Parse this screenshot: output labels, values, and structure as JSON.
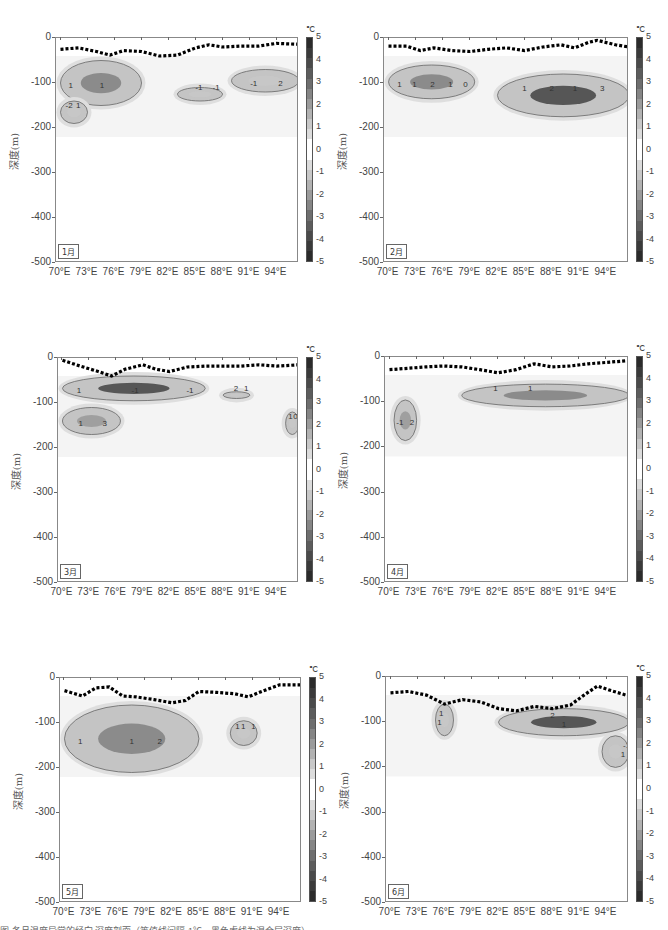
{
  "figure": {
    "y_label": "深度(m)",
    "colorbar_unit": "℃",
    "colorbar_ticks": [
      "5",
      "4",
      "3",
      "2",
      "1",
      "0",
      "-1",
      "-2",
      "-3",
      "-4",
      "-5"
    ],
    "colorbar_colors": [
      "#2b2b2b",
      "#3a3a3a",
      "#4a4a4a",
      "#5c5c5c",
      "#6e6e6e",
      "#858585",
      "#9b9b9b",
      "#b2b2b2",
      "#c8c8c8",
      "#dcdcdc",
      "#ffffff",
      "#ffffff",
      "#dcdcdc",
      "#c8c8c8",
      "#b2b2b2",
      "#9b9b9b",
      "#858585",
      "#6e6e6e",
      "#5c5c5c",
      "#4a4a4a",
      "#3a3a3a",
      "#2b2b2b"
    ],
    "y_ticks": [
      "0",
      "-100",
      "-200",
      "-300",
      "-400",
      "-500"
    ],
    "x_ticks": [
      "70°E",
      "73°E",
      "76°E",
      "79°E",
      "82°E",
      "85°E",
      "88°E",
      "91°E",
      "94°E"
    ],
    "caption_partial": "图 各月温度异常的经向-深度剖面（等值线间隔 1℃，黑色虚线为混合层深度）"
  },
  "chart_data": [
    {
      "type": "heatmap",
      "title": "1月",
      "xlabel": "",
      "ylabel": "深度(m)",
      "x_range": [
        "69.5°E",
        "96.5°E"
      ],
      "ylim": [
        -500,
        0
      ],
      "x_ticks": [
        "70°E",
        "73°E",
        "76°E",
        "79°E",
        "82°E",
        "85°E",
        "88°E",
        "91°E",
        "94°E"
      ],
      "y_ticks": [
        0,
        -100,
        -200,
        -300,
        -400,
        -500
      ],
      "colorbar": {
        "unit": "℃",
        "range": [
          -5,
          5
        ],
        "ticks": [
          5,
          4,
          3,
          2,
          1,
          0,
          -1,
          -2,
          -3,
          -4,
          -5
        ]
      },
      "contour_labels": [
        "1",
        "-1",
        "2",
        "-2",
        "1",
        "-1",
        "-1",
        "1"
      ],
      "mixed_layer_depth": {
        "lon": [
          70,
          72,
          74,
          75.5,
          77,
          79,
          81,
          83,
          85,
          86.5,
          88,
          90,
          92,
          94,
          96.5
        ],
        "depth": [
          -25,
          -22,
          -30,
          -38,
          -28,
          -30,
          -40,
          -38,
          -22,
          -15,
          -20,
          -18,
          -18,
          -12,
          -14
        ]
      },
      "anomaly_regions": [
        {
          "lon": [
            70,
            79
          ],
          "depth": [
            -50,
            -150
          ],
          "peak": "-2 to 2"
        },
        {
          "lon": [
            83,
            88
          ],
          "depth": [
            -110,
            -140
          ],
          "peak": "-1"
        },
        {
          "lon": [
            89,
            96.5
          ],
          "depth": [
            -70,
            -120
          ],
          "peak": "-1"
        },
        {
          "lon": [
            70,
            73
          ],
          "depth": [
            -140,
            -190
          ],
          "peak": "1"
        }
      ]
    },
    {
      "type": "heatmap",
      "title": "2月",
      "xlabel": "",
      "ylabel": "深度(m)",
      "x_range": [
        "69.5°E",
        "96.5°E"
      ],
      "ylim": [
        -500,
        0
      ],
      "x_ticks": [
        "70°E",
        "73°E",
        "76°E",
        "79°E",
        "82°E",
        "85°E",
        "88°E",
        "91°E",
        "94°E"
      ],
      "y_ticks": [
        0,
        -100,
        -200,
        -300,
        -400,
        -500
      ],
      "colorbar": {
        "unit": "℃",
        "range": [
          -5,
          5
        ],
        "ticks": [
          5,
          4,
          3,
          2,
          1,
          0,
          -1,
          -2,
          -3,
          -4,
          -5
        ]
      },
      "contour_labels": [
        "1",
        "2",
        "1",
        "1",
        "2",
        "3",
        "1",
        "1",
        "0"
      ],
      "mixed_layer_depth": {
        "lon": [
          70,
          72,
          73.5,
          75,
          77,
          79,
          81,
          83,
          85,
          87,
          89,
          90.5,
          92,
          93,
          95,
          96.5
        ],
        "depth": [
          -18,
          -18,
          -28,
          -22,
          -28,
          -30,
          -25,
          -22,
          -28,
          -20,
          -15,
          -22,
          -10,
          -5,
          -15,
          -20
        ]
      },
      "anomaly_regions": [
        {
          "lon": [
            70,
            79.5
          ],
          "depth": [
            -60,
            -135
          ],
          "peak": "2"
        },
        {
          "lon": [
            82,
            96.5
          ],
          "depth": [
            -80,
            -175
          ],
          "peak": "4"
        }
      ]
    },
    {
      "type": "heatmap",
      "title": "3月",
      "xlabel": "",
      "ylabel": "深度(m)",
      "x_range": [
        "69.5°E",
        "96.5°E"
      ],
      "ylim": [
        -500,
        0
      ],
      "x_ticks": [
        "70°E",
        "73°E",
        "76°E",
        "79°E",
        "82°E",
        "85°E",
        "88°E",
        "91°E",
        "94°E"
      ],
      "y_ticks": [
        0,
        -100,
        -200,
        -300,
        -400,
        -500
      ],
      "colorbar": {
        "unit": "℃",
        "range": [
          -5,
          5
        ],
        "ticks": [
          5,
          4,
          3,
          2,
          1,
          0,
          -1,
          -2,
          -3,
          -4,
          -5
        ]
      },
      "contour_labels": [
        "1",
        "2",
        "3",
        "1",
        "-1",
        "1",
        "1",
        "0",
        "-1"
      ],
      "mixed_layer_depth": {
        "lon": [
          70,
          72,
          74,
          75.5,
          77,
          79,
          80.5,
          82,
          84,
          86,
          88,
          90,
          92,
          94,
          96.5
        ],
        "depth": [
          -5,
          -18,
          -30,
          -40,
          -25,
          -15,
          -25,
          -30,
          -20,
          -18,
          -18,
          -18,
          -15,
          -18,
          -15
        ]
      },
      "anomaly_regions": [
        {
          "lon": [
            70,
            86
          ],
          "depth": [
            -40,
            -95
          ],
          "peak": "4"
        },
        {
          "lon": [
            88,
            91
          ],
          "depth": [
            -75,
            -90
          ],
          "peak": "1"
        },
        {
          "lon": [
            70,
            76.5
          ],
          "depth": [
            -110,
            -170
          ],
          "peak": "-1.5"
        },
        {
          "lon": [
            95,
            96.5
          ],
          "depth": [
            -120,
            -170
          ],
          "peak": "-1"
        }
      ]
    },
    {
      "type": "heatmap",
      "title": "4月",
      "xlabel": "",
      "ylabel": "深度(m)",
      "x_range": [
        "69.5°E",
        "96.5°E"
      ],
      "ylim": [
        -500,
        0
      ],
      "x_ticks": [
        "70°E",
        "73°E",
        "76°E",
        "79°E",
        "82°E",
        "85°E",
        "88°E",
        "91°E",
        "94°E"
      ],
      "y_ticks": [
        0,
        -100,
        -200,
        -300,
        -400,
        -500
      ],
      "colorbar": {
        "unit": "℃",
        "range": [
          -5,
          5
        ],
        "ticks": [
          5,
          4,
          3,
          2,
          1,
          0,
          -1,
          -2,
          -3,
          -4,
          -5
        ]
      },
      "contour_labels": [
        "-1",
        "1",
        "2",
        "1"
      ],
      "mixed_layer_depth": {
        "lon": [
          70,
          72,
          74,
          76,
          78,
          80,
          82,
          84,
          86,
          88,
          90,
          92,
          94,
          96.5
        ],
        "depth": [
          -28,
          -25,
          -22,
          -20,
          -22,
          -28,
          -35,
          -28,
          -15,
          -22,
          -20,
          -15,
          -12,
          -8
        ]
      },
      "anomaly_regions": [
        {
          "lon": [
            70.5,
            73
          ],
          "depth": [
            -95,
            -185
          ],
          "peak": "-1.5"
        },
        {
          "lon": [
            78,
            96.5
          ],
          "depth": [
            -60,
            -110
          ],
          "peak": "2"
        }
      ]
    },
    {
      "type": "heatmap",
      "title": "5月",
      "xlabel": "",
      "ylabel": "深度(m)",
      "x_range": [
        "69.5°E",
        "96.5°E"
      ],
      "ylim": [
        -500,
        0
      ],
      "x_ticks": [
        "70°E",
        "73°E",
        "76°E",
        "79°E",
        "82°E",
        "85°E",
        "88°E",
        "91°E",
        "94°E"
      ],
      "y_ticks": [
        0,
        -100,
        -200,
        -300,
        -400,
        -500
      ],
      "colorbar": {
        "unit": "℃",
        "range": [
          -5,
          5
        ],
        "ticks": [
          5,
          4,
          3,
          2,
          1,
          0,
          -1,
          -2,
          -3,
          -4,
          -5
        ]
      },
      "contour_labels": [
        "1",
        "1",
        "2",
        "1",
        "1",
        "1"
      ],
      "mixed_layer_depth": {
        "lon": [
          70,
          72,
          73.5,
          75,
          76.5,
          78,
          80,
          82,
          83.5,
          85,
          87,
          89,
          90.5,
          92,
          94,
          96.5
        ],
        "depth": [
          -28,
          -40,
          -22,
          -20,
          -40,
          -42,
          -48,
          -55,
          -50,
          -30,
          -32,
          -35,
          -42,
          -30,
          -15,
          -15
        ]
      },
      "anomaly_regions": [
        {
          "lon": [
            70,
            85
          ],
          "depth": [
            -60,
            -210
          ],
          "peak": "2.5"
        },
        {
          "lon": [
            88.5,
            91.5
          ],
          "depth": [
            -95,
            -150
          ],
          "peak": "1"
        }
      ]
    },
    {
      "type": "heatmap",
      "title": "6月",
      "xlabel": "",
      "ylabel": "深度(m)",
      "x_range": [
        "69.5°E",
        "96.5°E"
      ],
      "ylim": [
        -500,
        0
      ],
      "x_ticks": [
        "70°E",
        "73°E",
        "76°E",
        "79°E",
        "82°E",
        "85°E",
        "88°E",
        "91°E",
        "94°E"
      ],
      "y_ticks": [
        0,
        -100,
        -200,
        -300,
        -400,
        -500
      ],
      "colorbar": {
        "unit": "℃",
        "range": [
          -5,
          5
        ],
        "ticks": [
          5,
          4,
          3,
          2,
          1,
          0,
          -1,
          -2,
          -3,
          -4,
          -5
        ]
      },
      "contour_labels": [
        "1",
        "2",
        "1",
        "1",
        "1",
        "-1"
      ],
      "mixed_layer_depth": {
        "lon": [
          70,
          72,
          74,
          76,
          78,
          80,
          82,
          84,
          86,
          88,
          90,
          91.5,
          93,
          94.5,
          96.5
        ],
        "depth": [
          -35,
          -32,
          -40,
          -60,
          -50,
          -55,
          -70,
          -75,
          -65,
          -70,
          -62,
          -40,
          -20,
          -30,
          -42
        ]
      },
      "anomaly_regions": [
        {
          "lon": [
            75,
            77
          ],
          "depth": [
            -60,
            -130
          ],
          "peak": "1"
        },
        {
          "lon": [
            82,
            96.5
          ],
          "depth": [
            -70,
            -130
          ],
          "peak": "4"
        },
        {
          "lon": [
            93.5,
            96.5
          ],
          "depth": [
            -130,
            -200
          ],
          "peak": "-1"
        }
      ]
    }
  ]
}
